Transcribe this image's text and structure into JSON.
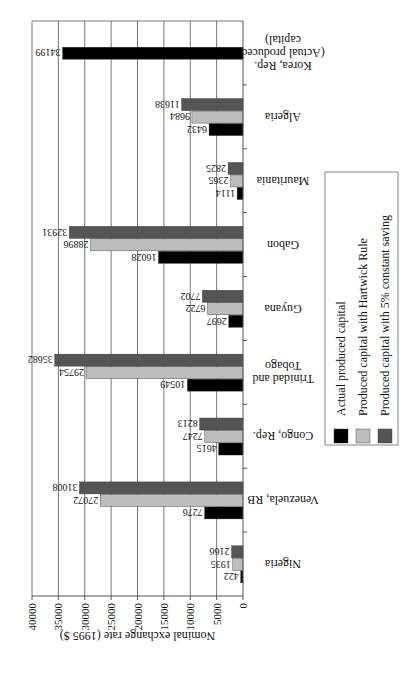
{
  "chart_data": {
    "type": "bar",
    "orientation": "horizontal",
    "figure_rotation": "upside-down (rotated 180 degrees), legend rotated to read bottom-to-top",
    "title": "",
    "xlabel": "Nominal exchange rate (1995 $)",
    "ylabel": "",
    "xlim": [
      0,
      40000
    ],
    "xticks": [
      "0",
      "5000",
      "10000",
      "15000",
      "20000",
      "25000",
      "30000",
      "35000",
      "40000"
    ],
    "grid": true,
    "legend_position": "right",
    "categories": [
      [
        "Nigeria"
      ],
      [
        "Venezuela, RB"
      ],
      [
        "Congo, Rep."
      ],
      [
        "Trinidad and",
        "Tobago"
      ],
      [
        "Guyana"
      ],
      [
        "Gabon"
      ],
      [
        "Mauritania"
      ],
      [
        "Algeria"
      ],
      [
        "Korea, Rep.",
        "(Actual produced",
        "capital)"
      ]
    ],
    "series": [
      {
        "name": "Actual produced capital",
        "color": "#000000",
        "values": [
          422,
          7276,
          4615,
          10549,
          2697,
          16028,
          1114,
          6432,
          34199
        ]
      },
      {
        "name": "Produced capital with Hartwick Rule",
        "color": "#bdbdbd",
        "values": [
          1935,
          27072,
          7247,
          29754,
          6722,
          28896,
          2365,
          9684,
          null
        ]
      },
      {
        "name": "Produced capital with 5% constant saving",
        "color": "#555555",
        "values": [
          2166,
          31008,
          8213,
          35682,
          7702,
          32931,
          2825,
          11638,
          null
        ]
      }
    ]
  }
}
